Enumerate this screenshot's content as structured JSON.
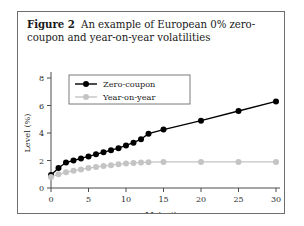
{
  "figure": {
    "label": "Figure 2",
    "caption": "An example of European 0% zero-coupon and year-on-year volatilities"
  },
  "chart_data": {
    "type": "line",
    "title": "",
    "xlabel": "Maturity",
    "ylabel": "Level (%)",
    "xlim": [
      0,
      30
    ],
    "ylim": [
      0,
      8
    ],
    "xticks": [
      0,
      5,
      10,
      15,
      20,
      25,
      30
    ],
    "yticks": [
      0,
      2,
      4,
      6,
      8
    ],
    "grid": false,
    "legend_position": "top-center",
    "series": [
      {
        "name": "Zero-coupon",
        "color": "#000000",
        "marker": "filled-circle",
        "x": [
          0,
          1,
          2,
          3,
          4,
          5,
          6,
          7,
          8,
          9,
          10,
          11,
          12,
          13,
          15,
          20,
          25,
          30
        ],
        "values": [
          0.95,
          1.45,
          1.85,
          2.0,
          2.15,
          2.3,
          2.45,
          2.6,
          2.75,
          2.9,
          3.1,
          3.3,
          3.55,
          3.95,
          4.25,
          4.9,
          5.6,
          6.3
        ]
      },
      {
        "name": "Year-on-year",
        "color": "#c4c4c4",
        "marker": "filled-circle",
        "x": [
          0,
          1,
          2,
          3,
          4,
          5,
          6,
          7,
          8,
          9,
          10,
          11,
          12,
          13,
          15,
          20,
          25,
          30
        ],
        "values": [
          0.8,
          1.0,
          1.15,
          1.25,
          1.35,
          1.45,
          1.52,
          1.6,
          1.66,
          1.72,
          1.78,
          1.82,
          1.86,
          1.88,
          1.9,
          1.9,
          1.9,
          1.9
        ]
      }
    ]
  },
  "legend": {
    "entries": [
      {
        "label": "Zero-coupon"
      },
      {
        "label": "Year-on-year"
      }
    ]
  }
}
